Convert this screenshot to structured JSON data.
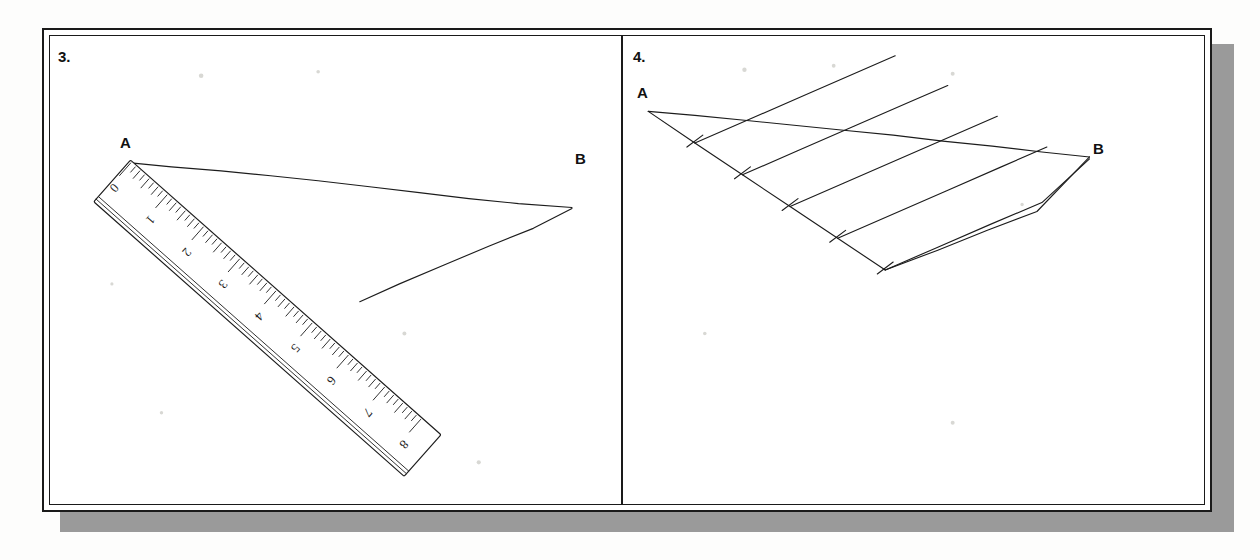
{
  "sheet": {
    "background_color": "#fdfdfc",
    "frame_border_color": "#1a1a1a",
    "shadow_color": "#9a9a9a",
    "ink_color": "#1c1c1c"
  },
  "panels": [
    {
      "id": "panel-3",
      "number_label": "3.",
      "caption": "Segment AB with a ruler aligned from A, and a second segment drawn from the 5 mark to B",
      "points": [
        {
          "name": "A",
          "label": "A",
          "x": 78,
          "y": 128
        },
        {
          "name": "B",
          "label": "B",
          "x": 525,
          "y": 172
        }
      ],
      "segments": [
        {
          "name": "segment-ab",
          "from": "A",
          "to": "B"
        },
        {
          "name": "segment-5-to-b",
          "from": "ruler-mark-5",
          "to": "B"
        }
      ],
      "ruler": {
        "name": "ruler",
        "zero_mark_label": "0",
        "major_marks": [
          "0",
          "1",
          "2",
          "3",
          "4",
          "5",
          "6",
          "7",
          "8"
        ],
        "minor_divisions_per_unit": 8,
        "units_shown": 8,
        "angle_degrees": 41,
        "note": "ruler's zero edge is placed at point A"
      }
    },
    {
      "id": "panel-4",
      "number_label": "4.",
      "caption": "Segment AB divided into five equal parts using a ray with five equal tick marks and four parallel lines",
      "points": [
        {
          "name": "A",
          "label": "A",
          "x": 22,
          "y": 75
        },
        {
          "name": "B",
          "label": "B",
          "x": 468,
          "y": 125
        }
      ],
      "ray": {
        "name": "construction-ray",
        "tick_count": 5,
        "tick_mark_style": "short cross stroke",
        "direction": "down-right from A"
      },
      "parallel_lines": {
        "name": "parallel-transversals",
        "count": 4,
        "direction": "up-right, parallel to the last tick-to-B line"
      },
      "segments": [
        {
          "name": "segment-ab",
          "from": "A",
          "to": "B"
        },
        {
          "name": "segment-tick5-to-b",
          "from": "tick-5",
          "to": "B"
        }
      ]
    }
  ]
}
